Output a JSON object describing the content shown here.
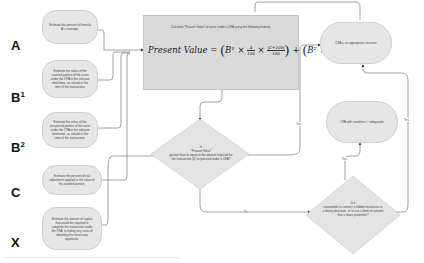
{
  "labels": {
    "a": "A",
    "b1_base": "B",
    "b1_sup": "1",
    "b2_base": "B",
    "b2_sup": "2",
    "c": "C",
    "x": "X"
  },
  "inputs": {
    "a": "Estimate the percent of formula A's coverage.",
    "b1": "Estimate the value of the covered portion of the asset under the CFA in the relevant timeframe, as valued at the time of the transaction.",
    "b2": "Estimate the value of the uncovered portion of the asset under the CFA in the relevant timeframe, as valued at the time of the transaction.",
    "c": "Estimate the percent of risk adjustment applied to the value of the covered portion.",
    "x": "Estimate the amount of capital that would be required to complete the transaction under the CFA, including any costs of obtaining the necessary approvals."
  },
  "formula_box": {
    "caption": "Calculate \"Present Value\" of asset under a CFA using the following formula:",
    "lhs": "Present Value",
    "eq": "=",
    "b1": "B¹",
    "times": "×",
    "a_num": "A",
    "a_den": "100",
    "c_num": "(C+100)",
    "c_den": "100",
    "plus": "+",
    "b2": "B²",
    "na_num": "(100−A)",
    "na_den": "100"
  },
  "decision_1": {
    "line1": "Is",
    "line2": "\"Present Value\"",
    "line3": "greater than or equal to the amount required for the transaction (X) to proceed under a CFA?"
  },
  "decision_2": {
    "line1": "Is it",
    "line2": "reasonable to connect a hidden disclosure or a liberty deviation, or to use a form of consent that is more protective?"
  },
  "outcomes": {
    "top": "CFA is an appropriate structure",
    "middle": "CFA with conditions / safeguards"
  },
  "edge_labels": {
    "yes_1": "Yes",
    "yes_2": "Yes",
    "yes_3": "Yes",
    "no_1": "No"
  }
}
